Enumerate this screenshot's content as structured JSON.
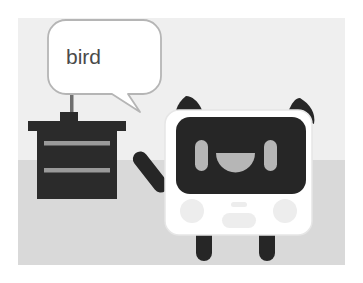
{
  "scene": {
    "title": "robot-says-bird-illustration",
    "type": "cartoon-illustration",
    "canvas": {
      "width": 363,
      "height": 283
    },
    "frame": {
      "margin_px": 18,
      "border_color": "#ffffff"
    },
    "background": {
      "wall_color": "#efefef",
      "floor_color": "#d9d9d9",
      "horizon_y": 160
    }
  },
  "speech_bubble": {
    "text": "bird",
    "fill_color": "#ffffff",
    "outline_color": "#b5b5b5",
    "text_color": "#4a4a4a",
    "tail_direction": "down-right",
    "bounds": {
      "x": 48,
      "y": 20,
      "width": 113,
      "height": 76
    }
  },
  "stem": {
    "label": "bubble-stem",
    "color": "#6e6e6e",
    "from": {
      "x": 72,
      "y": 94
    },
    "to": {
      "x": 72,
      "y": 124
    }
  },
  "desk": {
    "label": "desk",
    "body_color": "#2b2b2b",
    "drawer_line_color": "#9a9a9a",
    "top_slab": {
      "x": 28,
      "y": 122,
      "width": 98,
      "height": 9
    },
    "riser": {
      "x": 60,
      "y": 114,
      "width": 17,
      "height": 9
    },
    "body": {
      "x": 37,
      "y": 131,
      "width": 80,
      "height": 67
    },
    "drawer_lines": [
      {
        "y": 144
      },
      {
        "y": 170
      }
    ]
  },
  "robot": {
    "label": "panda-robot",
    "body_color": "#ffffff",
    "body_outline": "#e3e3e3",
    "dark_color": "#262626",
    "face_screen_color": "#262626",
    "eye_color": "#b6b6b6",
    "mouth_color": "#b6b6b6",
    "detail_color": "#ededed",
    "parts": [
      {
        "name": "left-ear",
        "shape": "triangle-rounded"
      },
      {
        "name": "right-ear",
        "shape": "triangle-rounded"
      },
      {
        "name": "left-arm",
        "shape": "diagonal-rounded-bar"
      },
      {
        "name": "right-tail",
        "shape": "vertical-rounded-bar"
      },
      {
        "name": "face-screen",
        "shape": "rounded-rect"
      },
      {
        "name": "left-eye",
        "shape": "vertical-pill"
      },
      {
        "name": "right-eye",
        "shape": "vertical-pill"
      },
      {
        "name": "smile",
        "shape": "semicircle"
      },
      {
        "name": "left-cheek",
        "shape": "circle"
      },
      {
        "name": "right-cheek",
        "shape": "circle"
      },
      {
        "name": "small-pill",
        "shape": "pill"
      },
      {
        "name": "chin-panel",
        "shape": "rounded-rect"
      },
      {
        "name": "left-leg",
        "shape": "rounded-bar"
      },
      {
        "name": "right-leg",
        "shape": "rounded-bar"
      }
    ],
    "body_bounds": {
      "x": 163,
      "y": 110,
      "width": 150,
      "height": 125
    }
  }
}
